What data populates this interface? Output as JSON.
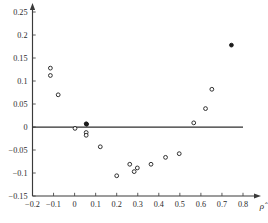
{
  "chart_data": {
    "type": "scatter",
    "title": "",
    "xlabel": "ρ̂",
    "ylabel": "",
    "xlim": [
      -0.2,
      0.8
    ],
    "ylim": [
      -0.15,
      0.25
    ],
    "grid": false,
    "legend": null,
    "x_ticks": [
      -0.2,
      -0.1,
      0,
      0.1,
      0.2,
      0.3,
      0.4,
      0.5,
      0.6,
      0.7,
      0.8
    ],
    "x_tick_labels": [
      "-0.2",
      "-0.1",
      "0",
      "0.1",
      "0.2",
      "0.3",
      "0.4",
      "0.5",
      "0.6",
      "0.7",
      "0.8"
    ],
    "y_ticks": [
      -0.15,
      -0.1,
      -0.05,
      0,
      0.05,
      0.1,
      0.15,
      0.2,
      0.25
    ],
    "y_tick_labels": [
      "-0.15",
      "-0.1",
      "-0.05",
      "0",
      "0.05",
      "0.1",
      "0.15",
      "0.2",
      "0.25"
    ],
    "reference_line": {
      "type": "horizontal",
      "y": 0,
      "x_start": -0.2,
      "x_end": 0.8
    },
    "marker": "open-circle",
    "points": [
      {
        "x": -0.115,
        "y": 0.128,
        "filled": false
      },
      {
        "x": -0.115,
        "y": 0.112,
        "filled": false
      },
      {
        "x": -0.078,
        "y": 0.07,
        "filled": false
      },
      {
        "x": 0.002,
        "y": -0.003,
        "filled": false
      },
      {
        "x": 0.055,
        "y": 0.007,
        "filled": true
      },
      {
        "x": 0.057,
        "y": 0.006,
        "filled": true
      },
      {
        "x": 0.055,
        "y": -0.012,
        "filled": false
      },
      {
        "x": 0.055,
        "y": -0.018,
        "filled": false
      },
      {
        "x": 0.122,
        "y": -0.043,
        "filled": false
      },
      {
        "x": 0.2,
        "y": -0.106,
        "filled": false
      },
      {
        "x": 0.262,
        "y": -0.081,
        "filled": false
      },
      {
        "x": 0.283,
        "y": -0.097,
        "filled": false
      },
      {
        "x": 0.298,
        "y": -0.089,
        "filled": false
      },
      {
        "x": 0.363,
        "y": -0.081,
        "filled": false
      },
      {
        "x": 0.432,
        "y": -0.066,
        "filled": false
      },
      {
        "x": 0.497,
        "y": -0.058,
        "filled": false
      },
      {
        "x": 0.566,
        "y": 0.009,
        "filled": false
      },
      {
        "x": 0.622,
        "y": 0.04,
        "filled": false
      },
      {
        "x": 0.652,
        "y": 0.082,
        "filled": false
      },
      {
        "x": 0.745,
        "y": 0.178,
        "filled": true
      }
    ]
  }
}
